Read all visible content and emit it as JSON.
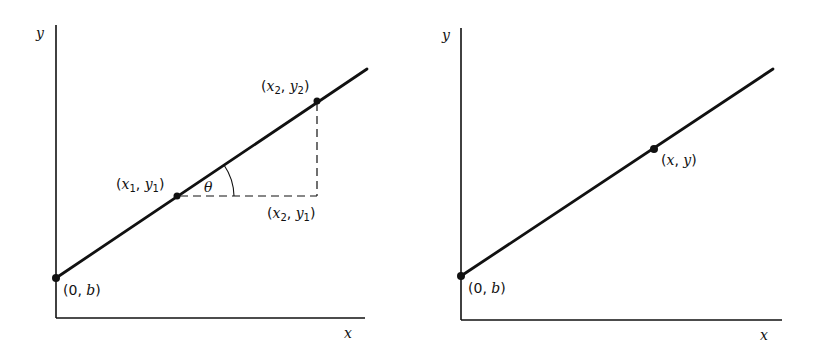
{
  "diagram": {
    "colors": {
      "line": "#111111",
      "background": "#ffffff"
    },
    "panels": [
      {
        "id": "left",
        "axes": {
          "x_label": "x",
          "y_label": "y"
        },
        "line": {
          "from": [
            56,
            278
          ],
          "to": [
            367,
            69
          ]
        },
        "points": [
          {
            "name": "intercept",
            "label_base": "0",
            "label_second": "b",
            "pos": [
              56,
              278
            ]
          },
          {
            "name": "p1",
            "label_var1": "x",
            "label_sub1": "1",
            "label_var2": "y",
            "label_sub2": "1",
            "pos": [
              177,
              196
            ]
          },
          {
            "name": "p2",
            "label_var1": "x",
            "label_sub1": "2",
            "label_var2": "y",
            "label_sub2": "2",
            "pos": [
              317,
              101
            ]
          }
        ],
        "corner": {
          "label_var1": "x",
          "label_sub1": "2",
          "label_var2": "y",
          "label_sub2": "1",
          "pos": [
            317,
            196
          ]
        },
        "angle": {
          "label": "θ"
        }
      },
      {
        "id": "right",
        "axes": {
          "x_label": "x",
          "y_label": "y"
        },
        "line": {
          "from": [
            461,
            276
          ],
          "to": [
            773,
            69
          ]
        },
        "points": [
          {
            "name": "intercept",
            "label_base": "0",
            "label_second": "b",
            "pos": [
              461,
              276
            ]
          },
          {
            "name": "general-point",
            "label_var1": "x",
            "label_var2": "y",
            "pos": [
              654,
              149
            ]
          }
        ]
      }
    ],
    "punct": {
      "open": "(",
      "close": ")",
      "comma": ", "
    }
  }
}
